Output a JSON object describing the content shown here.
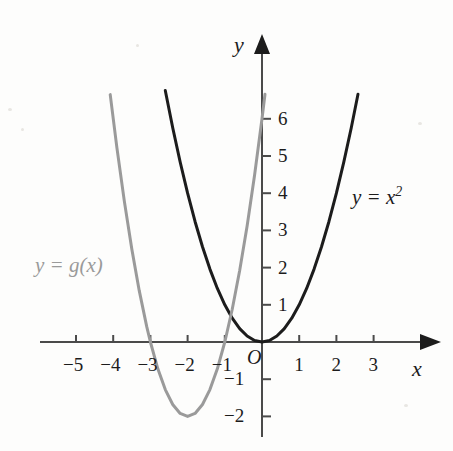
{
  "figure": {
    "background_color": "#fdfdfc",
    "axis_color": "#4a4a4a",
    "width": 453,
    "height": 451
  },
  "axes": {
    "x_name": "x",
    "y_name": "y",
    "origin_label": "O",
    "origin_px": {
      "x": 262,
      "y": 342
    },
    "unit_px": 37.2,
    "x_ticks": [
      {
        "value": -5,
        "label": "−5"
      },
      {
        "value": -4,
        "label": "−4"
      },
      {
        "value": -3,
        "label": "−3"
      },
      {
        "value": -2,
        "label": "−2"
      },
      {
        "value": -1,
        "label": "−1"
      },
      {
        "value": 1,
        "label": "1"
      },
      {
        "value": 2,
        "label": "2"
      },
      {
        "value": 3,
        "label": "3"
      }
    ],
    "y_ticks": [
      {
        "value": -2,
        "label": "−2"
      },
      {
        "value": -1,
        "label": "−1"
      },
      {
        "value": 1,
        "label": "1"
      },
      {
        "value": 2,
        "label": "2"
      },
      {
        "value": 3,
        "label": "3"
      },
      {
        "value": 4,
        "label": "4"
      },
      {
        "value": 5,
        "label": "5"
      },
      {
        "value": 6,
        "label": "6"
      }
    ]
  },
  "curve_labels": {
    "parabola_base": {
      "text_lead": "y = x",
      "exponent": "2",
      "color": "#1c1c1c",
      "px": {
        "x": 352,
        "y": 185
      }
    },
    "parabola_transformed": {
      "text": "y = g(x)",
      "color": "#9a9a9a",
      "px": {
        "x": 35,
        "y": 255
      }
    }
  },
  "chart_data": {
    "type": "line",
    "title": "",
    "xlabel": "x",
    "ylabel": "y",
    "xlim": [
      -5.8,
      3.9
    ],
    "ylim": [
      -2.9,
      7.6
    ],
    "grid": false,
    "legend": "inline-curve-labels",
    "series": [
      {
        "name": "y = x^2",
        "color": "#1c1c1c",
        "stroke_width": 3.0,
        "equation": "y = x^2",
        "vertex": [
          0,
          0
        ],
        "x_domain": [
          -2.6,
          2.58
        ],
        "points": [
          [
            -2.6,
            6.76
          ],
          [
            -2.4,
            5.76
          ],
          [
            -2.2,
            4.84
          ],
          [
            -2.0,
            4.0
          ],
          [
            -1.8,
            3.24
          ],
          [
            -1.6,
            2.56
          ],
          [
            -1.4,
            1.96
          ],
          [
            -1.2,
            1.44
          ],
          [
            -1.0,
            1.0
          ],
          [
            -0.8,
            0.64
          ],
          [
            -0.6,
            0.36
          ],
          [
            -0.4,
            0.16
          ],
          [
            -0.2,
            0.04
          ],
          [
            0.0,
            0.0
          ],
          [
            0.2,
            0.04
          ],
          [
            0.4,
            0.16
          ],
          [
            0.6,
            0.36
          ],
          [
            0.8,
            0.64
          ],
          [
            1.0,
            1.0
          ],
          [
            1.2,
            1.44
          ],
          [
            1.4,
            1.96
          ],
          [
            1.6,
            2.56
          ],
          [
            1.8,
            3.24
          ],
          [
            2.0,
            4.0
          ],
          [
            2.2,
            4.84
          ],
          [
            2.4,
            5.76
          ],
          [
            2.58,
            6.66
          ]
        ]
      },
      {
        "name": "y = g(x)",
        "color": "#9a9a9a",
        "stroke_width": 3.0,
        "equation": "y = 2(x + 2)^2 - 2",
        "vertex": [
          -2,
          -2
        ],
        "x_domain": [
          -4.08,
          0.08
        ],
        "x_intercepts": [
          -3,
          -1
        ],
        "y_intercept": 6,
        "points": [
          [
            -4.08,
            6.65
          ],
          [
            -3.9,
            5.22
          ],
          [
            -3.7,
            3.78
          ],
          [
            -3.5,
            2.5
          ],
          [
            -3.3,
            1.38
          ],
          [
            -3.1,
            0.42
          ],
          [
            -3.0,
            0.0
          ],
          [
            -2.8,
            -0.72
          ],
          [
            -2.6,
            -1.28
          ],
          [
            -2.4,
            -1.68
          ],
          [
            -2.2,
            -1.92
          ],
          [
            -2.0,
            -2.0
          ],
          [
            -1.8,
            -1.92
          ],
          [
            -1.6,
            -1.68
          ],
          [
            -1.4,
            -1.28
          ],
          [
            -1.2,
            -0.72
          ],
          [
            -1.0,
            0.0
          ],
          [
            -0.8,
            0.88
          ],
          [
            -0.6,
            1.92
          ],
          [
            -0.4,
            3.12
          ],
          [
            -0.2,
            4.48
          ],
          [
            0.0,
            6.0
          ],
          [
            0.08,
            6.66
          ]
        ]
      }
    ],
    "annotations": [
      {
        "text": "y = x²",
        "x": 2.42,
        "y": 4.22,
        "color": "#1c1c1c"
      },
      {
        "text": "y = g(x)",
        "x": -5.6,
        "y": 2.05,
        "color": "#9a9a9a"
      },
      {
        "text": "O",
        "x": -0.22,
        "y": -0.42,
        "color": "#1c1c1c"
      }
    ]
  }
}
